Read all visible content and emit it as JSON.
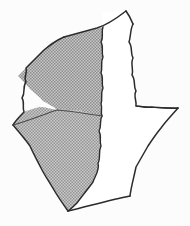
{
  "figure": {
    "kind": "line-drawing",
    "background_color": "#fcfcfc",
    "ink_color": "#2b2b2b",
    "shading_color": "#a4a4a4",
    "white_facet_color": "#ffffff",
    "facets": [
      {
        "id": "upper-left-facet",
        "label": "",
        "fill": "shaded"
      },
      {
        "id": "lower-left-facet",
        "label": "",
        "fill": "shaded"
      },
      {
        "id": "right-facet",
        "label": "",
        "fill": "white"
      }
    ],
    "vertices": {
      "top": "126,11",
      "top_left": "64,37",
      "left": "13,125",
      "bottom": "68,211",
      "bottom_right": "130,196",
      "right": "178,108"
    }
  },
  "caption": {
    "text": "",
    "visible": false
  }
}
